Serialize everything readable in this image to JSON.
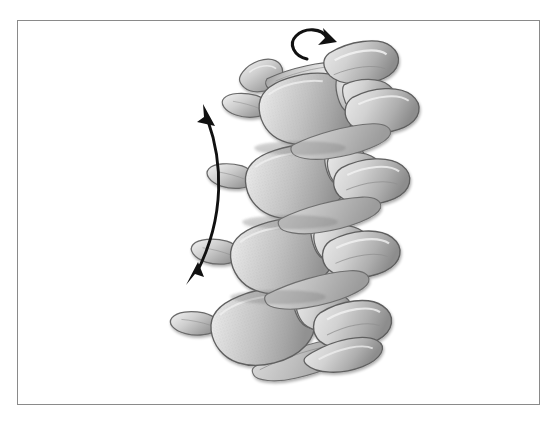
{
  "figure": {
    "domain": "anatomical-illustration",
    "title": "",
    "caption": "",
    "background_color": "#ffffff",
    "frame": {
      "name": "figure-border",
      "stroke_color": "#8a8a8a",
      "stroke_width": 1,
      "x": 17,
      "y": 20,
      "width": 523,
      "height": 385
    },
    "palette": {
      "bone_light": "#e8e8e8",
      "bone_mid": "#c6c6c6",
      "bone_dark": "#9a9a9a",
      "bone_shadow": "#7d7d7d",
      "outline": "#5a5a5a",
      "highlight": "#f5f5f5",
      "arrow": "#111111",
      "paper": "#ffffff"
    },
    "annotations": [
      {
        "name": "rotation-arrow",
        "type": "curved-single-headed-arrow",
        "meaning": "axial rotation",
        "label": "",
        "color": "#111111",
        "position": "top-center"
      },
      {
        "name": "flexion-extension-arrow",
        "type": "curved-double-headed-arrow",
        "meaning": "flexion and extension",
        "label": "",
        "color": "#111111",
        "position": "left-side"
      }
    ],
    "vertebrae": [
      {
        "name": "vertebra-1",
        "order": 1,
        "cx": 292,
        "cy": 100,
        "rotation": -12,
        "scale": 1.0
      },
      {
        "name": "vertebra-2",
        "order": 2,
        "cx": 283,
        "cy": 175,
        "rotation": -12,
        "scale": 1.03
      },
      {
        "name": "vertebra-3",
        "order": 3,
        "cx": 272,
        "cy": 250,
        "rotation": -13,
        "scale": 1.05
      },
      {
        "name": "vertebra-4",
        "order": 4,
        "cx": 258,
        "cy": 325,
        "rotation": -16,
        "scale": 1.06
      }
    ]
  },
  "chart_data": {
    "type": "table",
    "categories": [
      "axial rotation",
      "flexion-extension"
    ],
    "values": [
      1,
      2
    ],
    "xlabel": "",
    "ylabel": "arrow heads"
  }
}
